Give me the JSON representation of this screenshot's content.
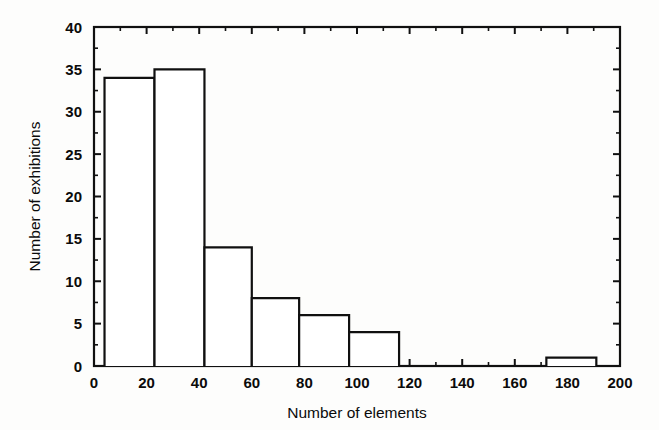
{
  "chart_data": {
    "type": "bar",
    "title": "",
    "subtitle": "",
    "xlabel": "Number of elements",
    "ylabel": "Number of exhibitions",
    "xlim": [
      0,
      200
    ],
    "ylim": [
      0,
      40
    ],
    "x_tick_labels": [
      "0",
      "20",
      "40",
      "60",
      "80",
      "100",
      "120",
      "140",
      "160",
      "180",
      "200"
    ],
    "x_tick_values": [
      0,
      20,
      40,
      60,
      80,
      100,
      120,
      140,
      160,
      180,
      200
    ],
    "x_minor_step": 10,
    "y_tick_labels": [
      "0",
      "5",
      "10",
      "15",
      "20",
      "25",
      "30",
      "35",
      "40"
    ],
    "y_tick_values": [
      0,
      5,
      10,
      15,
      20,
      25,
      30,
      35,
      40
    ],
    "y_minor_step": 2.5,
    "grid": false,
    "legend": null,
    "frame": "box",
    "tick_direction": "in",
    "bar_fill": "#ffffff",
    "bar_edge": "#101010",
    "bins": [
      {
        "bin_start": 4,
        "bin_end": 23,
        "label": "4-23",
        "value": 34
      },
      {
        "bin_start": 23,
        "bin_end": 42,
        "label": "23-42",
        "value": 35
      },
      {
        "bin_start": 42,
        "bin_end": 60,
        "label": "42-60",
        "value": 14
      },
      {
        "bin_start": 60,
        "bin_end": 78,
        "label": "60-78",
        "value": 8
      },
      {
        "bin_start": 78,
        "bin_end": 97,
        "label": "78-97",
        "value": 6
      },
      {
        "bin_start": 97,
        "bin_end": 116,
        "label": "97-116",
        "value": 4
      },
      {
        "bin_start": 172,
        "bin_end": 191,
        "label": "172-191",
        "value": 1
      }
    ],
    "categories": [
      "4-23",
      "23-42",
      "42-60",
      "60-78",
      "78-97",
      "97-116",
      "172-191"
    ],
    "values": [
      34,
      35,
      14,
      8,
      6,
      4,
      1
    ]
  }
}
